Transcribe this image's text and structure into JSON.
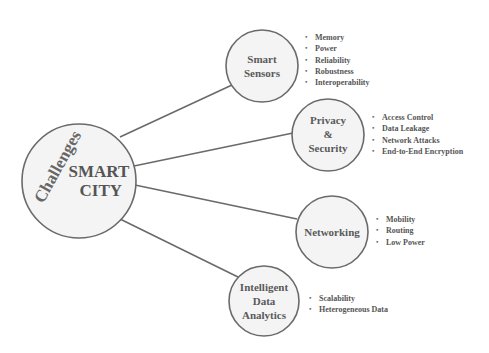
{
  "diagram": {
    "type": "mind-map",
    "colors": {
      "stroke": "#6a6a6a",
      "fill": "#f3f3f3",
      "text": "#555555"
    },
    "center": {
      "rotated_label": "Challenges",
      "line1": "SMART",
      "line2": "CITY"
    },
    "nodes": [
      {
        "id": "smart-sensors",
        "label_lines": [
          "Smart",
          "Sensors"
        ],
        "items": [
          "Memory",
          "Power",
          "Reliability",
          "Robustness",
          "Interoperability"
        ]
      },
      {
        "id": "privacy-security",
        "label_lines": [
          "Privacy",
          "&",
          "Security"
        ],
        "items": [
          "Access Control",
          "Data Leakage",
          "Network Attacks",
          "End-to-End Encryption"
        ]
      },
      {
        "id": "networking",
        "label_lines": [
          "Networking"
        ],
        "items": [
          "Mobility",
          "Routing",
          "Low Power"
        ]
      },
      {
        "id": "intelligent-data-analytics",
        "label_lines": [
          "Intelligent",
          "Data",
          "Analytics"
        ],
        "items": [
          "Scalability",
          "Heterogeneous Data"
        ]
      }
    ]
  }
}
